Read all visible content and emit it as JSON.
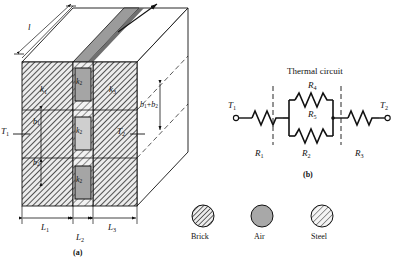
{
  "figure": {
    "panel_a": {
      "caption": "(a)",
      "temperature_left": "T",
      "temperature_left_sub": "1",
      "temperature_right": "T",
      "temperature_right_sub": "2",
      "length_top": "l",
      "conductivity_labels": [
        {
          "base": "k",
          "sub": "1",
          "material": "brick"
        },
        {
          "base": "k",
          "sub": "2",
          "material": "air"
        },
        {
          "base": "k",
          "sub": "3",
          "material": "brick"
        },
        {
          "base": "k",
          "sub": "2",
          "material": "air"
        },
        {
          "base": "k",
          "sub": "2",
          "material": "air"
        }
      ],
      "width_labels": [
        {
          "base": "L",
          "sub": "1"
        },
        {
          "base": "L",
          "sub": "2"
        },
        {
          "base": "L",
          "sub": "3"
        }
      ],
      "height_labels": [
        {
          "base": "b",
          "sub": "1"
        },
        {
          "base": "b",
          "sub": "2"
        }
      ],
      "depth_label": {
        "text": "b",
        "sub": "1",
        "plus": "+",
        "text2": "b",
        "sub2": "2"
      }
    },
    "panel_b": {
      "caption": "(b)",
      "title": "Thermal circuit",
      "node_left": {
        "base": "T",
        "sub": "1"
      },
      "node_right": {
        "base": "T",
        "sub": "2"
      },
      "resistors": [
        {
          "base": "R",
          "sub": "1",
          "position": "series-left"
        },
        {
          "base": "R",
          "sub": "4",
          "position": "parallel-top"
        },
        {
          "base": "R",
          "sub": "5",
          "position": "parallel-bottom"
        },
        {
          "base": "R",
          "sub": "2",
          "position": "parallel-group-label"
        },
        {
          "base": "R",
          "sub": "3",
          "position": "series-right"
        }
      ]
    },
    "legend": {
      "items": [
        {
          "label": "Brick",
          "fill": "hatch-dark"
        },
        {
          "label": "Air",
          "fill": "solid-gray"
        },
        {
          "label": "Steel",
          "fill": "hatch-light"
        }
      ]
    },
    "colors": {
      "line": "#111111",
      "brick_hatch_bg": "#e8e8e8",
      "air_fill": "#a8a8a8",
      "steel_fill": "#d2d2d2",
      "steel_band": "#9a9a9a",
      "face_side": "#ffffff"
    }
  }
}
